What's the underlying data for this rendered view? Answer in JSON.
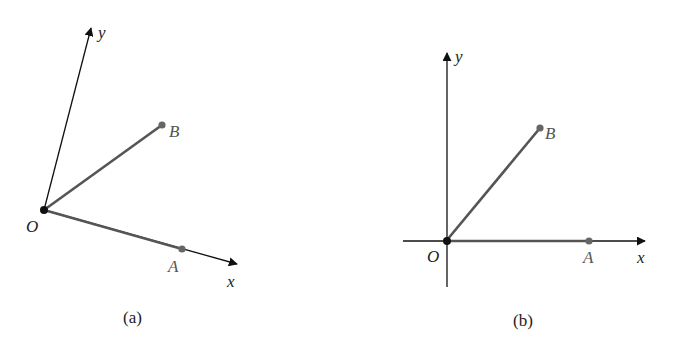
{
  "figure_a": {
    "caption": "(a)",
    "axes": {
      "x_label": "x",
      "y_label": "y"
    },
    "points": {
      "origin": "O",
      "a": "A",
      "b": "B"
    },
    "coords": {
      "origin": [
        44,
        210
      ],
      "y_tip": [
        92,
        25
      ],
      "x_tip": [
        240,
        265
      ],
      "a": [
        182,
        249
      ],
      "b": [
        162,
        125
      ]
    }
  },
  "figure_b": {
    "caption": "(b)",
    "axes": {
      "x_label": "x",
      "y_label": "y"
    },
    "points": {
      "origin": "O",
      "a": "A",
      "b": "B"
    },
    "coords": {
      "origin": [
        447,
        240
      ],
      "y_tip": [
        447,
        50
      ],
      "y_bottom": [
        447,
        287
      ],
      "x_start": [
        403,
        240
      ],
      "x_tip": [
        648,
        240
      ],
      "a": [
        589,
        241
      ],
      "b": [
        540,
        128
      ]
    }
  },
  "colors": {
    "axis": "#111111",
    "segment": "#555555",
    "point": "#666666",
    "origin": "#111111"
  }
}
